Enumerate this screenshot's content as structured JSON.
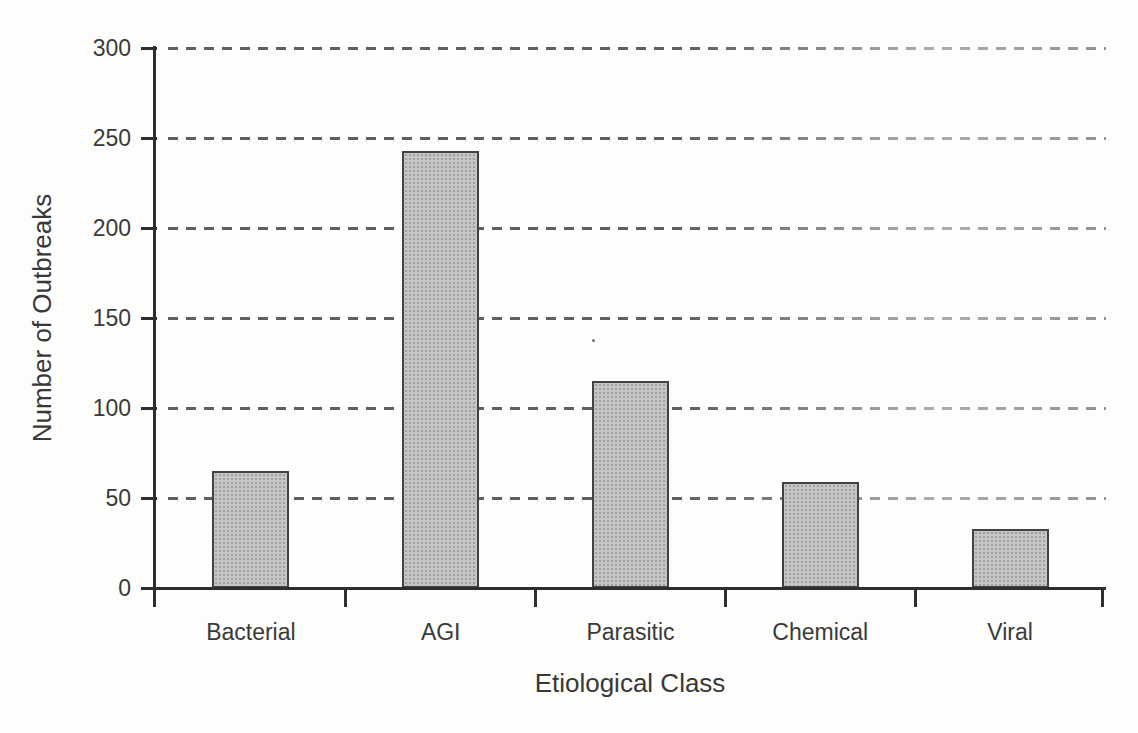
{
  "figure": {
    "background_color": "#fdfdfc",
    "text_color": "#3a3a3a",
    "axis_color": "#2e2e2e",
    "gridline_color": "#5f5f5f",
    "bar_fill_color": "#cbcac8",
    "bar_border_color": "#424242"
  },
  "chart_data": {
    "type": "bar",
    "categories": [
      "Bacterial",
      "AGI",
      "Parasitic",
      "Chemical",
      "Viral"
    ],
    "values": [
      65,
      243,
      115,
      59,
      33
    ],
    "title": "",
    "xlabel": "Etiological Class",
    "ylabel": "Number of Outbreaks",
    "ylim": [
      0,
      300
    ],
    "yticks": [
      0,
      50,
      100,
      150,
      200,
      250,
      300
    ],
    "grid": "horizontal-dashed",
    "legend": "none"
  }
}
